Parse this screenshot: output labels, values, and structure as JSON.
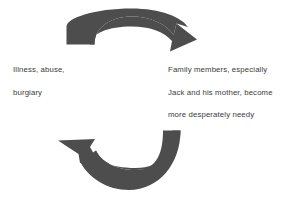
{
  "diagram": {
    "type": "cycle",
    "direction": "clockwise",
    "background_color": "#ffffff",
    "arrow_color": "#4d4d4d",
    "text_color": "#3b3b3b",
    "arrows": [
      {
        "name": "top-arrow",
        "description": "curved arc sweeping left-to-right across the top, arrowhead at right pointing down-right",
        "from": "left-label",
        "to": "right-label"
      },
      {
        "name": "bottom-arrow",
        "description": "curved arc sweeping right-to-left across the bottom, arrowhead at left pointing up-left",
        "from": "right-label",
        "to": "left-label"
      }
    ],
    "labels": {
      "left": {
        "name": "cause-label",
        "lines": [
          "Illness, abuse,",
          "burglary"
        ]
      },
      "right": {
        "name": "effect-label",
        "lines": [
          "Family members, especially",
          "Jack and his mother, become",
          "more desperately needy"
        ]
      }
    }
  }
}
